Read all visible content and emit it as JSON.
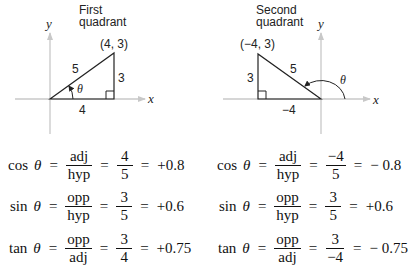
{
  "first_quadrant": {
    "title_line1": "First",
    "title_line2": "quadrant",
    "y_axis_label": "y",
    "x_axis_label": "x",
    "point_label": "(4, 3)",
    "hypotenuse_label": "5",
    "opposite_label": "3",
    "adjacent_label": "4",
    "angle_label": "θ",
    "point": [
      4,
      3
    ]
  },
  "second_quadrant": {
    "title_line1": "Second",
    "title_line2": "quadrant",
    "y_axis_label": "y",
    "x_axis_label": "x",
    "point_label": "(−4, 3)",
    "hypotenuse_label": "5",
    "opposite_label": "3",
    "adjacent_label": "−4",
    "angle_label": "θ",
    "point": [
      -4,
      3
    ]
  },
  "first_equations": [
    {
      "fn": "cos",
      "var": "θ",
      "ratio_num": "adj",
      "ratio_den": "hyp",
      "value_num": "4",
      "value_den": "5",
      "result": "+0.8"
    },
    {
      "fn": "sin",
      "var": "θ",
      "ratio_num": "opp",
      "ratio_den": "hyp",
      "value_num": "3",
      "value_den": "5",
      "result": "+0.6"
    },
    {
      "fn": "tan",
      "var": "θ",
      "ratio_num": "opp",
      "ratio_den": "adj",
      "value_num": "3",
      "value_den": "4",
      "result": "+0.75"
    }
  ],
  "second_equations": [
    {
      "fn": "cos",
      "var": "θ",
      "ratio_num": "adj",
      "ratio_den": "hyp",
      "value_num": "−4",
      "value_den": "5",
      "result": "− 0.8"
    },
    {
      "fn": "sin",
      "var": "θ",
      "ratio_num": "opp",
      "ratio_den": "hyp",
      "value_num": "3",
      "value_den": "5",
      "result": "+0.6"
    },
    {
      "fn": "tan",
      "var": "θ",
      "ratio_num": "opp",
      "ratio_den": "adj",
      "value_num": "3",
      "value_den": "−4",
      "result": "− 0.75"
    }
  ],
  "equals_sign": "="
}
